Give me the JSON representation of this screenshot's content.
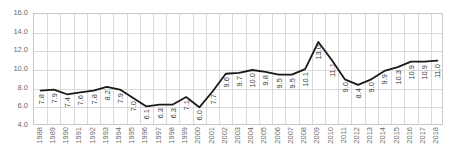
{
  "chart_data": {
    "type": "line",
    "title": "",
    "subtitle": "",
    "xlabel": "",
    "ylabel": "",
    "ylim": [
      4.0,
      16.0
    ],
    "ytick_step": 2.0,
    "yticks": [
      "4.0",
      "6.0",
      "8.0",
      "10.0",
      "12.0",
      "14.0",
      "16.0"
    ],
    "grid": true,
    "legend": false,
    "legend_position": "none",
    "line_color": "#1a1a1a",
    "grid_color": "#d9d9d9",
    "axis_color": "#c8c8c8",
    "label_color": "#6b6b6b",
    "data_label_color": "#3a3a3a",
    "categories": [
      "1988",
      "1989",
      "1990",
      "1991",
      "1992",
      "1993",
      "1994",
      "1995",
      "1996",
      "1997",
      "1998",
      "1999",
      "2000",
      "2001",
      "2002",
      "2003",
      "2004",
      "2005",
      "2006",
      "2007",
      "2008",
      "2009",
      "2010",
      "2011",
      "2012",
      "2013",
      "2014",
      "2015",
      "2016",
      "2017",
      "2018"
    ],
    "values": [
      7.8,
      7.9,
      7.4,
      7.6,
      7.8,
      8.2,
      7.9,
      7.0,
      6.1,
      6.3,
      6.3,
      7.1,
      6.0,
      7.7,
      9.6,
      9.7,
      10.0,
      9.8,
      9.5,
      9.5,
      10.1,
      13.0,
      11.1,
      9.0,
      8.4,
      9.0,
      9.9,
      10.3,
      10.9,
      10.9,
      11.0
    ],
    "data_labels": [
      "7.8",
      "7.9",
      "7.4",
      "7.6",
      "7.8",
      "8.2",
      "7.9",
      "7.0",
      "6.1",
      "6.3",
      "6.3",
      "7.1",
      "6.0",
      "7.7",
      "9.6",
      "9.7",
      "10.0",
      "9.8",
      "9.5",
      "9.5",
      "10.1",
      "13.0",
      "11.1",
      "9.0",
      "8.4",
      "9.0",
      "9.9",
      "10.3",
      "10.9",
      "10.9",
      "11.0"
    ],
    "series": [
      {
        "name": "",
        "values": [
          7.8,
          7.9,
          7.4,
          7.6,
          7.8,
          8.2,
          7.9,
          7.0,
          6.1,
          6.3,
          6.3,
          7.1,
          6.0,
          7.7,
          9.6,
          9.7,
          10.0,
          9.8,
          9.5,
          9.5,
          10.1,
          13.0,
          11.1,
          9.0,
          8.4,
          9.0,
          9.9,
          10.3,
          10.9,
          10.9,
          11.0
        ]
      }
    ]
  }
}
